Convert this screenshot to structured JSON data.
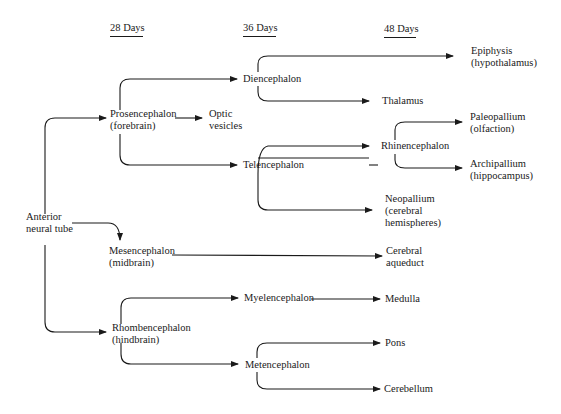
{
  "headers": [
    {
      "id": "d28",
      "label": "28 Days"
    },
    {
      "id": "d36",
      "label": "36 Days"
    },
    {
      "id": "d48",
      "label": "48 Days"
    }
  ],
  "nodes": {
    "anterior": {
      "l1": "Anterior",
      "l2": "neural tube"
    },
    "prosencephalon": {
      "l1": "Prosencephalon",
      "l2": "(forebrain)"
    },
    "optic": {
      "l1": "Optic",
      "l2": "vesicles"
    },
    "diencephalon": {
      "l1": "Diencephalon"
    },
    "epiphysis": {
      "l1": "Epiphysis",
      "l2": "(hypothalamus)"
    },
    "thalamus": {
      "l1": "Thalamus"
    },
    "telencephalon": {
      "l1": "Telencephalon"
    },
    "rhinencephalon": {
      "l1": "Rhinencephalon"
    },
    "paleopallium": {
      "l1": "Paleopallium",
      "l2": "(olfaction)"
    },
    "archipallium": {
      "l1": "Archipallium",
      "l2": "(hippocampus)"
    },
    "neopallium": {
      "l1": "Neopallium",
      "l2": "(cerebral",
      "l3": "hemispheres)"
    },
    "mesencephalon": {
      "l1": "Mesencephalon",
      "l2": "(midbrain)"
    },
    "aqueduct": {
      "l1": "Cerebral",
      "l2": "aqueduct"
    },
    "rhombencephalon": {
      "l1": "Rhombencephalon",
      "l2": "(hindbrain)"
    },
    "myelencephalon": {
      "l1": "Myelencephalon"
    },
    "medulla": {
      "l1": "Medulla"
    },
    "metencephalon": {
      "l1": "Metencephalon"
    },
    "pons": {
      "l1": "Pons"
    },
    "cerebellum": {
      "l1": "Cerebellum"
    }
  },
  "edges": [
    [
      "anterior",
      "prosencephalon"
    ],
    [
      "anterior",
      "mesencephalon"
    ],
    [
      "anterior",
      "rhombencephalon"
    ],
    [
      "prosencephalon",
      "diencephalon"
    ],
    [
      "prosencephalon",
      "optic"
    ],
    [
      "prosencephalon",
      "telencephalon"
    ],
    [
      "diencephalon",
      "epiphysis"
    ],
    [
      "diencephalon",
      "thalamus"
    ],
    [
      "telencephalon",
      "rhinencephalon"
    ],
    [
      "telencephalon",
      "neopallium"
    ],
    [
      "rhinencephalon",
      "paleopallium"
    ],
    [
      "rhinencephalon",
      "archipallium"
    ],
    [
      "mesencephalon",
      "aqueduct"
    ],
    [
      "rhombencephalon",
      "myelencephalon"
    ],
    [
      "rhombencephalon",
      "metencephalon"
    ],
    [
      "myelencephalon",
      "medulla"
    ],
    [
      "metencephalon",
      "pons"
    ],
    [
      "metencephalon",
      "cerebellum"
    ]
  ]
}
